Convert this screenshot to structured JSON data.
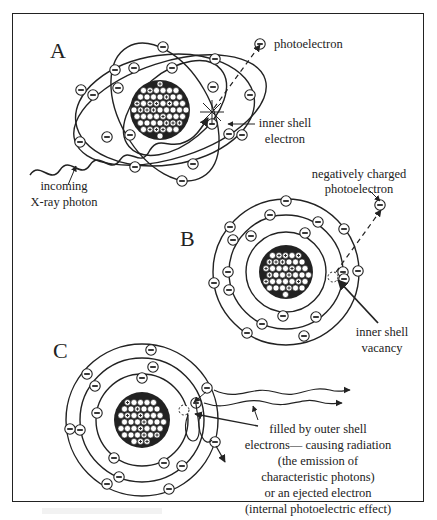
{
  "figure": {
    "panels": [
      {
        "id": "A",
        "label": "A"
      },
      {
        "id": "B",
        "label": "B"
      },
      {
        "id": "C",
        "label": "C"
      }
    ],
    "labels": {
      "photoelectron": "photoelectron",
      "inner_shell_electron": [
        "inner shell",
        "electron"
      ],
      "incoming_xray": [
        "incoming",
        "X-ray photon"
      ],
      "negatively_charged": [
        "negatively charged",
        "photoelectron"
      ],
      "inner_shell_vacancy": [
        "inner shell",
        "vacancy"
      ],
      "filled_by": [
        "filled by outer shell",
        "electrons— causing radiation",
        "(the emission of",
        "characteristic photons)",
        "or an ejected electron",
        "(internal photoelectric effect)"
      ]
    },
    "symbols": {
      "electron": "−",
      "proton": "+"
    },
    "colors": {
      "ink": "#222222",
      "background": "#ffffff"
    }
  }
}
